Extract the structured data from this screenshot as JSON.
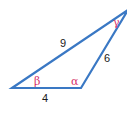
{
  "diagram": {
    "type": "triangle",
    "stroke_color": "#3a78c4",
    "angle_label_color": "#d6336c",
    "sides": [
      {
        "id": "side-left",
        "label": "9"
      },
      {
        "id": "side-right",
        "label": "6"
      },
      {
        "id": "side-bottom",
        "label": "4"
      }
    ],
    "angles": [
      {
        "id": "beta",
        "label": "β"
      },
      {
        "id": "alpha",
        "label": "α"
      },
      {
        "id": "gamma",
        "label": "γ"
      }
    ]
  }
}
